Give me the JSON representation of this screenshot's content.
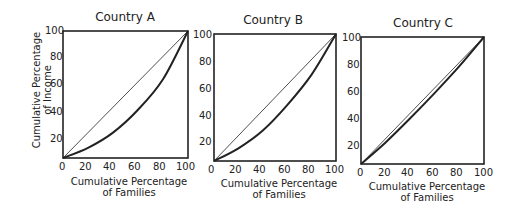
{
  "chart_data": [
    {
      "type": "line",
      "title": "Country A",
      "xlabel": "Cumulative Percentage of Families",
      "xlabel_lines": [
        "Cumulative Percentage",
        "of Families"
      ],
      "ylabel": "Cumulative Percentage of Income",
      "ylabel_lines": [
        "Cumulative Percentage",
        "of Income"
      ],
      "xticks": [
        "0",
        "20",
        "40",
        "60",
        "80",
        "100"
      ],
      "yticks": [
        "20",
        "40",
        "60",
        "80",
        "100"
      ],
      "xlim": [
        0,
        100
      ],
      "ylim": [
        0,
        100
      ],
      "grid": false,
      "series": [
        {
          "name": "Line of equality",
          "x": [
            0,
            100
          ],
          "y": [
            0,
            100
          ]
        },
        {
          "name": "Lorenz curve",
          "x": [
            0,
            20,
            40,
            60,
            80,
            100
          ],
          "y": [
            0,
            8,
            20,
            38,
            62,
            100
          ]
        }
      ]
    },
    {
      "type": "line",
      "title": "Country B",
      "xlabel": "Cumulative Percentage of Families",
      "xlabel_lines": [
        "Cumulative Percentage",
        "of Families"
      ],
      "ylabel": "",
      "xticks": [
        "0",
        "20",
        "40",
        "60",
        "80",
        "100"
      ],
      "yticks": [
        "20",
        "40",
        "60",
        "80",
        "100"
      ],
      "xlim": [
        0,
        100
      ],
      "ylim": [
        0,
        100
      ],
      "grid": false,
      "series": [
        {
          "name": "Line of equality",
          "x": [
            0,
            100
          ],
          "y": [
            0,
            100
          ]
        },
        {
          "name": "Lorenz curve",
          "x": [
            0,
            20,
            40,
            60,
            80,
            100
          ],
          "y": [
            0,
            10,
            24,
            44,
            68,
            100
          ]
        }
      ]
    },
    {
      "type": "line",
      "title": "Country C",
      "xlabel": "Cumulative Percentage of Families",
      "xlabel_lines": [
        "Cumulative Percentage",
        "of Families"
      ],
      "ylabel": "",
      "xticks": [
        "0",
        "20",
        "40",
        "60",
        "80",
        "100"
      ],
      "yticks": [
        "20",
        "40",
        "60",
        "80",
        "100"
      ],
      "xlim": [
        0,
        100
      ],
      "ylim": [
        0,
        100
      ],
      "grid": false,
      "series": [
        {
          "name": "Line of equality",
          "x": [
            0,
            100
          ],
          "y": [
            0,
            100
          ]
        },
        {
          "name": "Lorenz curve",
          "x": [
            0,
            20,
            40,
            60,
            80,
            100
          ],
          "y": [
            0,
            17,
            36,
            56,
            77,
            100
          ]
        }
      ]
    }
  ]
}
